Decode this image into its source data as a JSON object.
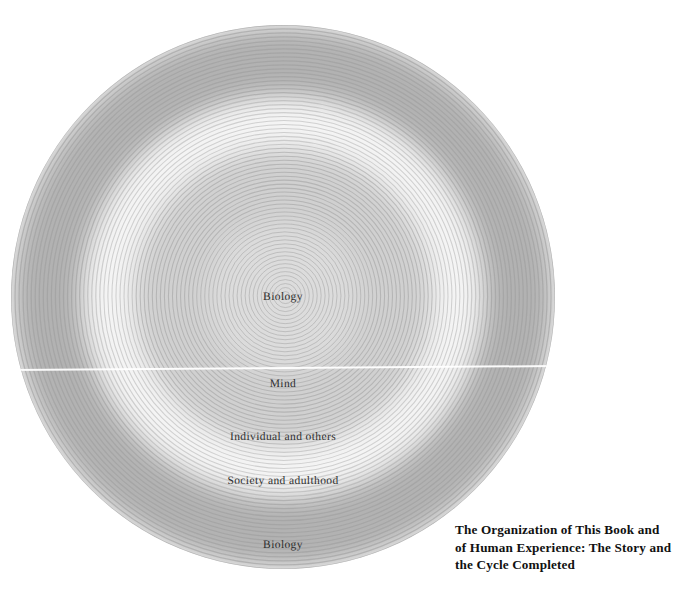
{
  "figure": {
    "kind": "concentric-rings-diagram",
    "background_color": "#ffffff",
    "center": {
      "x": 283,
      "y": 297
    },
    "outer_radius": 272,
    "ring_stroke_color": "#9a9a9a",
    "ring_spacing_px": 4,
    "ring_count": 68,
    "scanline": {
      "y": 368,
      "color": "#ffffff"
    }
  },
  "bands": [
    {
      "name": "core-biology",
      "inner_radius": 0,
      "outer_radius": 76,
      "fill": "#dcdcdc"
    },
    {
      "name": "mind",
      "inner_radius": 76,
      "outer_radius": 150,
      "fill": "#d0d0d0"
    },
    {
      "name": "individual",
      "inner_radius": 150,
      "outer_radius": 200,
      "fill": "#f4f4f4"
    },
    {
      "name": "society",
      "inner_radius": 200,
      "outer_radius": 272,
      "fill": "#b2b2b2"
    }
  ],
  "labels": [
    {
      "id": "label-biology-center",
      "text": "Biology",
      "x": 283,
      "y": 297,
      "font_size": 11.5
    },
    {
      "id": "label-mind",
      "text": "Mind",
      "x": 283,
      "y": 384,
      "font_size": 11.5
    },
    {
      "id": "label-individual",
      "text": "Individual and others",
      "x": 283,
      "y": 437,
      "font_size": 11.5
    },
    {
      "id": "label-society",
      "text": "Society and adulthood",
      "x": 283,
      "y": 481,
      "font_size": 11.5
    },
    {
      "id": "label-biology-outer",
      "text": "Biology",
      "x": 283,
      "y": 545,
      "font_size": 11.5
    }
  ],
  "caption": {
    "lines": [
      "The Organization of This Book and",
      "of Human Experience: The Story and",
      "the Cycle Completed"
    ],
    "color": "#111111"
  }
}
